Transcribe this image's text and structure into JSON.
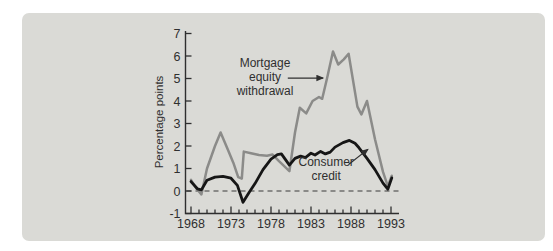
{
  "figure": {
    "background": "#ffffff",
    "panel_bg": "#dadad6",
    "text_color": "#2f2f2f",
    "axis_color": "#2f2f2f",
    "zero_line_color": "#3a3a3a"
  },
  "chart_data": {
    "type": "line",
    "title": "",
    "xlabel": "",
    "ylabel": "Percentage points",
    "xlim": [
      1968,
      1993
    ],
    "ylim": [
      -1,
      7
    ],
    "x_major_ticks": [
      1968,
      1973,
      1978,
      1983,
      1988,
      1993
    ],
    "x_minor_tick_interval": 1,
    "y_ticks": [
      -1,
      0,
      1,
      2,
      3,
      4,
      5,
      6,
      7
    ],
    "grid": false,
    "zero_line": "dashed",
    "legend_position": "inline-annotations",
    "series": [
      {
        "name": "Mortgage equity withdrawal",
        "color": "#8b8b89",
        "stroke_width": 2.5,
        "points": [
          [
            1968,
            0.5
          ],
          [
            1968.7,
            0.1
          ],
          [
            1969.3,
            -0.15
          ],
          [
            1970,
            1.0
          ],
          [
            1971,
            2.0
          ],
          [
            1971.7,
            2.6
          ],
          [
            1972.6,
            1.85
          ],
          [
            1973.3,
            1.25
          ],
          [
            1973.9,
            0.62
          ],
          [
            1974.35,
            0.55
          ],
          [
            1974.6,
            1.75
          ],
          [
            1975.5,
            1.68
          ],
          [
            1976.5,
            1.6
          ],
          [
            1977.5,
            1.57
          ],
          [
            1978.2,
            1.62
          ],
          [
            1979,
            1.33
          ],
          [
            1980.3,
            0.88
          ],
          [
            1981,
            2.6
          ],
          [
            1981.6,
            3.7
          ],
          [
            1982.4,
            3.45
          ],
          [
            1983.2,
            4.0
          ],
          [
            1984,
            4.18
          ],
          [
            1984.4,
            4.1
          ],
          [
            1985,
            5.0
          ],
          [
            1985.75,
            6.2
          ],
          [
            1986.4,
            5.62
          ],
          [
            1987.1,
            5.85
          ],
          [
            1987.7,
            6.1
          ],
          [
            1988.8,
            3.75
          ],
          [
            1989.3,
            3.4
          ],
          [
            1990,
            4.0
          ],
          [
            1991,
            2.3
          ],
          [
            1992,
            0.85
          ],
          [
            1992.6,
            0.22
          ],
          [
            1993.1,
            0.68
          ]
        ]
      },
      {
        "name": "Consumer credit",
        "color": "#161616",
        "stroke_width": 2.8,
        "points": [
          [
            1968,
            0.42
          ],
          [
            1968.8,
            0.1
          ],
          [
            1969.3,
            0.05
          ],
          [
            1970,
            0.48
          ],
          [
            1971,
            0.62
          ],
          [
            1972,
            0.65
          ],
          [
            1973,
            0.57
          ],
          [
            1973.8,
            0.25
          ],
          [
            1974.5,
            -0.5
          ],
          [
            1975.3,
            -0.05
          ],
          [
            1976,
            0.33
          ],
          [
            1977,
            0.95
          ],
          [
            1978,
            1.42
          ],
          [
            1978.8,
            1.62
          ],
          [
            1979.3,
            1.65
          ],
          [
            1980.3,
            1.15
          ],
          [
            1981,
            1.45
          ],
          [
            1981.7,
            1.55
          ],
          [
            1982.3,
            1.48
          ],
          [
            1983,
            1.68
          ],
          [
            1983.5,
            1.6
          ],
          [
            1984.2,
            1.76
          ],
          [
            1984.8,
            1.65
          ],
          [
            1985.4,
            1.73
          ],
          [
            1986,
            1.95
          ],
          [
            1987,
            2.15
          ],
          [
            1987.8,
            2.25
          ],
          [
            1988.5,
            2.12
          ],
          [
            1989,
            1.92
          ],
          [
            1990,
            1.45
          ],
          [
            1991,
            0.95
          ],
          [
            1992,
            0.35
          ],
          [
            1992.6,
            0.08
          ],
          [
            1993.1,
            0.58
          ]
        ]
      }
    ],
    "annotations": [
      {
        "name": "mortgage-equity-withdrawal-label",
        "lines": [
          "Mortgage",
          "equity",
          "withdrawal"
        ],
        "anchor_year": 1977.25,
        "anchor_value": 5.69,
        "arrow": {
          "from": [
            1980.1,
            5.02
          ],
          "to": [
            1984.5,
            5.02
          ]
        }
      },
      {
        "name": "consumer-credit-label",
        "lines": [
          "Consumer",
          "credit"
        ],
        "anchor_year": 1984.9,
        "anchor_value": 1.31,
        "arrow": {
          "from": [
            1987.7,
            1.18
          ],
          "to": [
            1990.1,
            1.85
          ]
        }
      }
    ]
  }
}
